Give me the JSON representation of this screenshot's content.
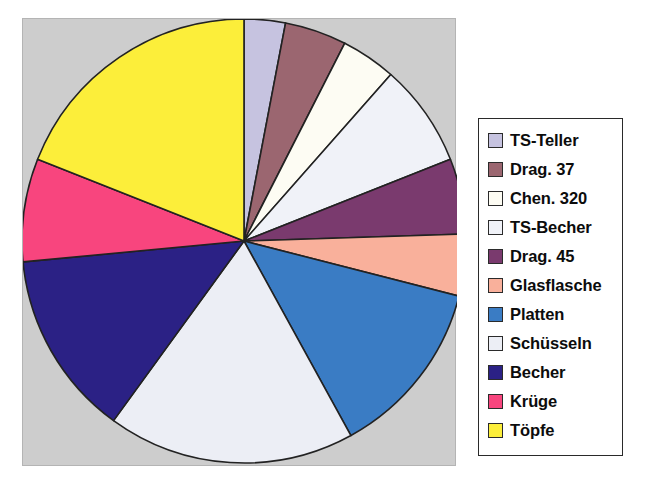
{
  "chart_data": {
    "type": "pie",
    "title": "",
    "subtitle": "",
    "xlabel": "",
    "ylabel": "",
    "grid": false,
    "legend_position": "right",
    "start_angle_deg": 0,
    "direction": "clockwise",
    "categories": [
      "TS-Teller",
      "Drag. 37",
      "Chen. 320",
      "TS-Becher",
      "Drag. 45",
      "Glasflasche",
      "Platten",
      "Schüsseln",
      "Becher",
      "Krüge",
      "Töpfe"
    ],
    "values": [
      3.0,
      4.5,
      4.0,
      7.5,
      5.5,
      4.5,
      13.0,
      18.0,
      13.5,
      7.5,
      19.0
    ],
    "colors": [
      "#c6c3e0",
      "#9b6670",
      "#fdfcf3",
      "#f0f2f8",
      "#7a3a6e",
      "#f9b09b",
      "#3a7cc4",
      "#eceef5",
      "#2b2185",
      "#f8457e",
      "#fcee3a"
    ],
    "slice_border_color": "#222222",
    "plot_background": "#cdcdcd",
    "chart_background": "#ffffff"
  },
  "legend": {
    "items": [
      {
        "label": "TS-Teller",
        "color": "#c6c3e0"
      },
      {
        "label": "Drag. 37",
        "color": "#9b6670"
      },
      {
        "label": "Chen. 320",
        "color": "#fdfcf3"
      },
      {
        "label": "TS-Becher",
        "color": "#f0f2f8"
      },
      {
        "label": "Drag. 45",
        "color": "#7a3a6e"
      },
      {
        "label": "Glasflasche",
        "color": "#f9b09b"
      },
      {
        "label": "Platten",
        "color": "#3a7cc4"
      },
      {
        "label": "Schüsseln",
        "color": "#eceef5"
      },
      {
        "label": "Becher",
        "color": "#2b2185"
      },
      {
        "label": "Krüge",
        "color": "#f8457e"
      },
      {
        "label": "Töpfe",
        "color": "#fcee3a"
      }
    ]
  }
}
